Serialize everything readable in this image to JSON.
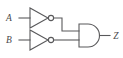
{
  "figure": {
    "background_color": "#ffffff",
    "line_color": "#59595b",
    "label_color": "#4a4a4c",
    "width": 123,
    "height": 58
  },
  "labels": {
    "input_a": "A",
    "input_b": "B",
    "output_z": "Z"
  },
  "circuit": {
    "inputs": [
      "A",
      "B"
    ],
    "output": "Z",
    "gates": [
      {
        "id": "inverter-a",
        "type": "NOT",
        "symbol": "triangle-with-bubble",
        "inputs": [
          "A"
        ],
        "output": "not_A"
      },
      {
        "id": "inverter-b",
        "type": "NOT",
        "symbol": "triangle-with-bubble",
        "inputs": [
          "B"
        ],
        "output": "not_B"
      },
      {
        "id": "and-gate",
        "type": "AND",
        "symbol": "d-shape",
        "inputs": [
          "not_A",
          "not_B"
        ],
        "output": "Z"
      }
    ],
    "expression": "Z = (NOT A) AND (NOT B)"
  }
}
